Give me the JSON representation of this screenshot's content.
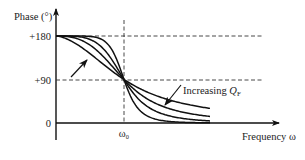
{
  "diagram": {
    "y_axis_label": "Phase (°)",
    "x_axis_label": "Frequency ω",
    "y_ticks": [
      "+180",
      "+90",
      "0"
    ],
    "x_ticks": [
      "ω₀"
    ],
    "annotation": {
      "text": "Increasing ",
      "symbol": "Q",
      "subscript": "F"
    }
  },
  "chart_data": {
    "type": "line",
    "title": "",
    "xlabel": "Frequency ω",
    "ylabel": "Phase (°)",
    "ylim": [
      0,
      180
    ],
    "y_ticks": [
      0,
      90,
      180
    ],
    "x_ticks": [
      "ω₀"
    ],
    "x_range_relative_to_w0": [
      0,
      2.2
    ],
    "center_point": {
      "x": "ω₀",
      "y": 90
    },
    "series": [
      {
        "name": "Q_F level 1 (lowest)",
        "steepness": 1.6
      },
      {
        "name": "Q_F level 2",
        "steepness": 2.6
      },
      {
        "name": "Q_F level 3",
        "steepness": 4.0
      },
      {
        "name": "Q_F level 4 (highest)",
        "steepness": 7.0
      }
    ],
    "annotations": [
      "Increasing Q_F (arrow pointing toward steeper curves)"
    ],
    "reference_lines": [
      {
        "orientation": "horizontal",
        "y": 180,
        "style": "dashed"
      },
      {
        "orientation": "horizontal",
        "y": 90,
        "style": "dashed"
      },
      {
        "orientation": "vertical",
        "x": "ω₀",
        "style": "dashed"
      }
    ],
    "legend": "none",
    "grid": false
  }
}
